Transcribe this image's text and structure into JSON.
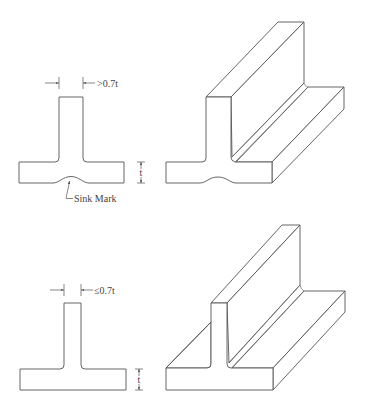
{
  "figure": {
    "colors": {
      "line": "#555555",
      "text": "#444444",
      "background": "#ffffff"
    }
  },
  "top_example": {
    "rib_dimension_label": ">0.7t",
    "thickness_label": "t",
    "defect_label": "Sink Mark"
  },
  "bottom_example": {
    "rib_dimension_label": "≤0.7t",
    "thickness_label": "t"
  }
}
